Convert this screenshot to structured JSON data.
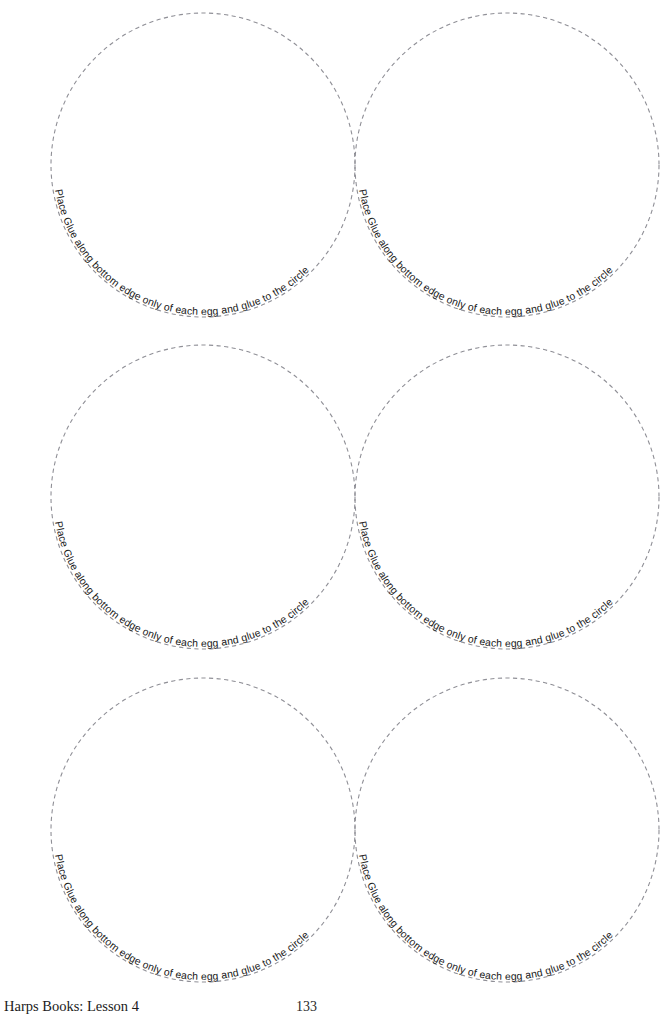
{
  "document": {
    "title": "Egg Gluing Circle Template Worksheet",
    "background_color": "#ffffff",
    "width": 660,
    "height": 1015
  },
  "instruction_text": "Place Glue along bottom edge only of each egg and glue to the circle",
  "colors": {
    "dash_stroke": "#8f8f96",
    "text": "#171717",
    "footer_text": "#1b1b1b",
    "page_background": "#ffffff"
  },
  "circles": [
    {
      "id": "circle-row1-left",
      "label": "Place Glue along bottom edge only of each egg and glue to the circle",
      "cx": 203,
      "cy": 165,
      "r": 152,
      "left": 51,
      "top": 13
    },
    {
      "id": "circle-row1-right",
      "label": "Place Glue along bottom edge only of each egg and glue to the circle",
      "cx": 507,
      "cy": 165,
      "r": 152,
      "left": 355,
      "top": 13
    },
    {
      "id": "circle-row2-left",
      "label": "Place Glue along bottom edge only of each egg and glue to the circle",
      "cx": 203,
      "cy": 497,
      "r": 152,
      "left": 51,
      "top": 345
    },
    {
      "id": "circle-row2-right",
      "label": "Place Glue along bottom edge only of each egg and glue to the circle",
      "cx": 507,
      "cy": 497,
      "r": 152,
      "left": 355,
      "top": 345
    },
    {
      "id": "circle-row3-left",
      "label": "Place Glue along bottom edge only of each egg and glue to the circle",
      "cx": 203,
      "cy": 830,
      "r": 152,
      "left": 51,
      "top": 678
    },
    {
      "id": "circle-row3-right",
      "label": "Place Glue along bottom edge only of each egg and glue to the circle",
      "cx": 507,
      "cy": 830,
      "r": 152,
      "left": 355,
      "top": 678
    }
  ],
  "footer": {
    "source": "Harps Books: Lesson 4",
    "page_number": "133"
  }
}
